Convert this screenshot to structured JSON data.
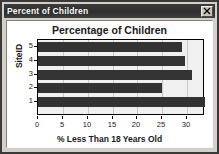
{
  "window": {
    "title": "Percent of Children",
    "close_icon": "close-icon",
    "close_label": "X"
  },
  "chart_data": {
    "type": "bar",
    "orientation": "horizontal",
    "title": "Percentage of Children",
    "xlabel": "% Less Than 18 Years Old",
    "ylabel": "SiteID",
    "categories": [
      "1",
      "2",
      "3",
      "4",
      "5"
    ],
    "values": [
      33.5,
      25.0,
      31.0,
      29.5,
      29.0
    ],
    "xlim": [
      0,
      33.6
    ],
    "ylim": [
      0,
      5.5
    ],
    "xticks": [
      0,
      5,
      10,
      15,
      20,
      25,
      30
    ],
    "xtick_labels": [
      "0",
      "5",
      "10",
      "15",
      "20",
      "25",
      "30"
    ],
    "yticks": [
      1,
      2,
      3,
      4,
      5
    ],
    "ytick_labels": [
      "1",
      "2",
      "3",
      "4",
      "5"
    ],
    "grid": true,
    "grid_axis": "x",
    "legend": false,
    "bar_color": "#333333",
    "plot_background": "#f0f0f0",
    "series": [
      {
        "name": "% Less Than 18 Years Old",
        "values": [
          33.5,
          25.0,
          31.0,
          29.5,
          29.0
        ]
      }
    ]
  }
}
